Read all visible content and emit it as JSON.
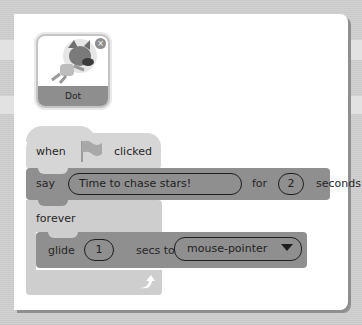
{
  "sprite": {
    "name": "Dot",
    "close_icon": "×"
  },
  "script": {
    "hat_block": {
      "label_before": "when",
      "icon": "green-flag-icon",
      "label_after": "clicked"
    },
    "say_block": {
      "label": "say",
      "message": "Time to chase stars!",
      "for_label": "for",
      "duration": "2",
      "unit_label": "seconds"
    },
    "forever_block": {
      "label": "forever",
      "loop_icon": "loop-arrow-icon"
    },
    "glide_block": {
      "label": "glide",
      "duration": "1",
      "secs_to_label": "secs to",
      "target": "mouse-pointer"
    }
  },
  "colors": {
    "panel": "#ffffff",
    "say_block": "#8f8f8f",
    "glide_block": "#8f8f8f",
    "forever_block": "#cecece",
    "hat_block": "#d6d6d6"
  }
}
